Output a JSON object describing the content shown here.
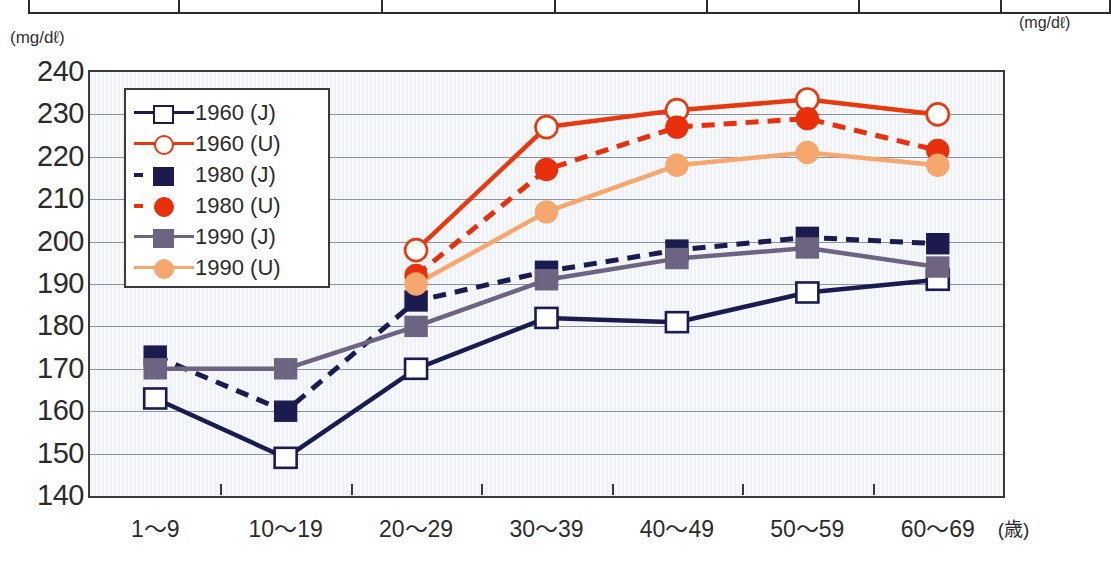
{
  "units": {
    "left_axis": "(mg/dℓ)",
    "right_top": "(mg/dℓ)"
  },
  "axis": {
    "x_unit": "(歳)",
    "y_ticks": [
      "240",
      "230",
      "220",
      "210",
      "200",
      "190",
      "180",
      "170",
      "160",
      "150",
      "140"
    ],
    "x_ticks": [
      "1～9",
      "10～19",
      "20～29",
      "30～39",
      "40～49",
      "50～59",
      "60～69"
    ]
  },
  "legend": {
    "items": [
      {
        "label": "1960 (J)",
        "color": "#1b1b4f",
        "marker": "square-open",
        "line": "solid"
      },
      {
        "label": "1960 (U)",
        "color": "#e8380d",
        "marker": "circle-open",
        "line": "solid"
      },
      {
        "label": "1980 (J)",
        "color": "#1b1b4f",
        "marker": "square-filled",
        "line": "dashed"
      },
      {
        "label": "1980 (U)",
        "color": "#e8300c",
        "marker": "circle-filled",
        "line": "dashed"
      },
      {
        "label": "1990 (J)",
        "color": "#6c6480",
        "marker": "square-filled",
        "line": "solid"
      },
      {
        "label": "1990 (U)",
        "color": "#f6a76d",
        "marker": "circle-filled",
        "line": "solid"
      }
    ]
  },
  "chart_data": {
    "type": "line",
    "title": "",
    "xlabel": "(歳)",
    "ylabel": "(mg/dℓ)",
    "ylim": [
      140,
      240
    ],
    "ytick_step": 10,
    "grid": true,
    "legend_position": "inside-top-left",
    "categories": [
      "1～9",
      "10～19",
      "20～29",
      "30～39",
      "40～49",
      "50～59",
      "60～69"
    ],
    "series": [
      {
        "name": "1960 (J)",
        "color": "#1b1b4f",
        "line": "solid",
        "marker": "square-open",
        "values": [
          163,
          149,
          170,
          182,
          181,
          188,
          191
        ]
      },
      {
        "name": "1960 (U)",
        "color": "#e8380d",
        "line": "solid",
        "marker": "circle-open",
        "values": [
          null,
          null,
          198,
          227,
          231,
          233.5,
          230
        ]
      },
      {
        "name": "1980 (J)",
        "color": "#1b1b4f",
        "line": "dashed",
        "marker": "square-filled",
        "values": [
          173,
          160,
          186,
          193,
          198,
          201,
          199.5
        ]
      },
      {
        "name": "1980 (U)",
        "color": "#e8300c",
        "line": "dashed",
        "marker": "circle-filled",
        "values": [
          null,
          null,
          192,
          217,
          227,
          229,
          221.5
        ]
      },
      {
        "name": "1990 (J)",
        "color": "#6c6480",
        "line": "solid",
        "marker": "square-filled",
        "values": [
          170,
          170,
          180,
          191,
          196,
          198.5,
          194
        ]
      },
      {
        "name": "1990 (U)",
        "color": "#f6a76d",
        "line": "solid",
        "marker": "circle-filled",
        "values": [
          null,
          null,
          190,
          207,
          218,
          221,
          218
        ]
      }
    ]
  }
}
